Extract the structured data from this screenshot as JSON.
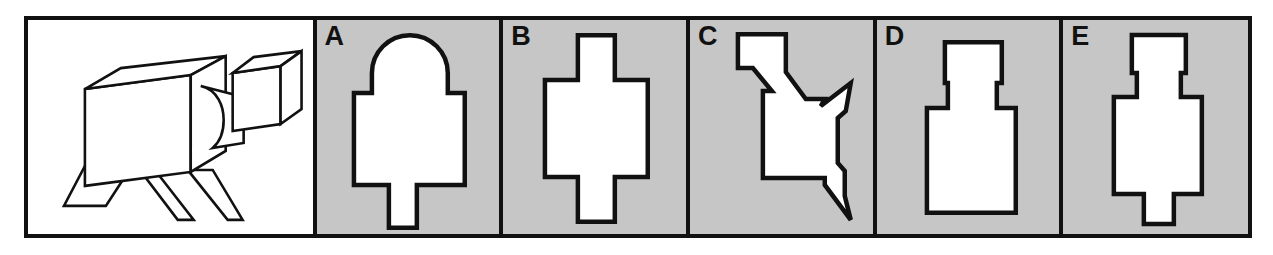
{
  "item": {
    "type": "silhouette-matching",
    "panel_count": 6,
    "frame_border_color": "#111111",
    "option_background_color": "#c6c6c6",
    "stimulus_background_color": "#ffffff",
    "shape_fill_color": "#ffffff",
    "shape_outline_color": "#111111"
  },
  "stimulus": {
    "label": "",
    "name": "three-dimensional-block-figure",
    "description": "Large rectangular box body on two flat angled legs, with a short connector arm extending to the upper right to a smaller cube"
  },
  "options": [
    {
      "letter": "A",
      "name": "dome-top-wide-body-stem",
      "description": "Rounded dome top on a wide rectangle with a narrow stem below"
    },
    {
      "letter": "B",
      "name": "wide-body-with-top-and-bottom-stems",
      "description": "Wide rectangle with equal narrow stems above and below"
    },
    {
      "letter": "C",
      "name": "irregular-angled-polygon",
      "description": "Irregular polygon with slanted notched edges and two pointed spurs on the right"
    },
    {
      "letter": "D",
      "name": "narrow-top-neck-wide-body",
      "description": "Medium rectangle on top, short narrow neck, wide tall rectangle below"
    },
    {
      "letter": "E",
      "name": "narrow-top-neck-body-foot",
      "description": "Medium rectangle on top, narrow neck, wide body, narrow foot at bottom"
    }
  ]
}
